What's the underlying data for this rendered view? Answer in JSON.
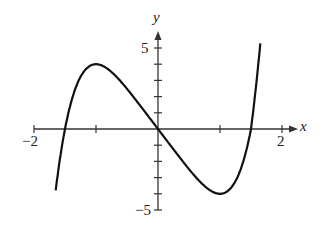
{
  "chart_data": {
    "type": "line",
    "title": "",
    "xlabel": "x",
    "ylabel": "y",
    "xlim": [
      -2,
      2
    ],
    "ylim": [
      -5,
      5
    ],
    "x_tick_labels": [
      "-2",
      "2"
    ],
    "y_tick_labels": [
      "5",
      "-5"
    ],
    "x_ticks": [
      -2,
      -1,
      1,
      2
    ],
    "y_ticks": [
      -5,
      -4,
      -3,
      -2,
      -1,
      1,
      2,
      3,
      4,
      5
    ],
    "grid": false,
    "series": [
      {
        "name": "f(x)",
        "x": [
          -1.65,
          -1.5,
          -1.25,
          -1.0,
          -0.75,
          -0.5,
          -0.25,
          0,
          0.25,
          0.5,
          0.75,
          1.0,
          1.25,
          1.5,
          1.65
        ],
        "y": [
          -5.0,
          0.0,
          3.3,
          4.0,
          3.4,
          2.5,
          1.3,
          0.0,
          -1.3,
          -2.5,
          -3.4,
          -4.0,
          -3.3,
          0.0,
          5.3
        ]
      }
    ],
    "annotations": {
      "local_max": [
        -1,
        4
      ],
      "local_min": [
        1,
        -4
      ],
      "x_intercepts": [
        -1.5,
        0,
        1.5
      ]
    }
  },
  "labels": {
    "x_axis": "x",
    "y_axis": "y",
    "xmin": "−2",
    "xmax": "2",
    "ymax": "5",
    "ymin": "−5"
  }
}
